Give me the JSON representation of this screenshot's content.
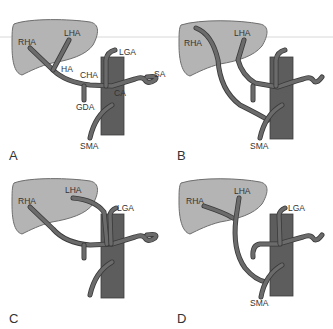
{
  "figure": {
    "colors": {
      "liver": "#b4b4b4",
      "aorta": "#5d5d5d",
      "vessel": "#6b6b6b",
      "text": "#333333"
    },
    "panels": [
      {
        "letter": "A",
        "labels": {
          "rha": "RHA",
          "lha": "LHA",
          "ha": "HA",
          "cha": "CHA",
          "lga": "LGA",
          "sa": "SA",
          "ca": "CA",
          "gda": "GDA",
          "sma": "SMA"
        }
      },
      {
        "letter": "B",
        "labels": {
          "rha": "RHA",
          "lha": "LHA",
          "sma": "SMA"
        }
      },
      {
        "letter": "C",
        "labels": {
          "rha": "RHA",
          "lha": "LHA",
          "lga": "LGA"
        }
      },
      {
        "letter": "D",
        "labels": {
          "rha": "RHA",
          "lha": "LHA",
          "lga": "LGA",
          "sma": "SMA"
        }
      }
    ]
  }
}
